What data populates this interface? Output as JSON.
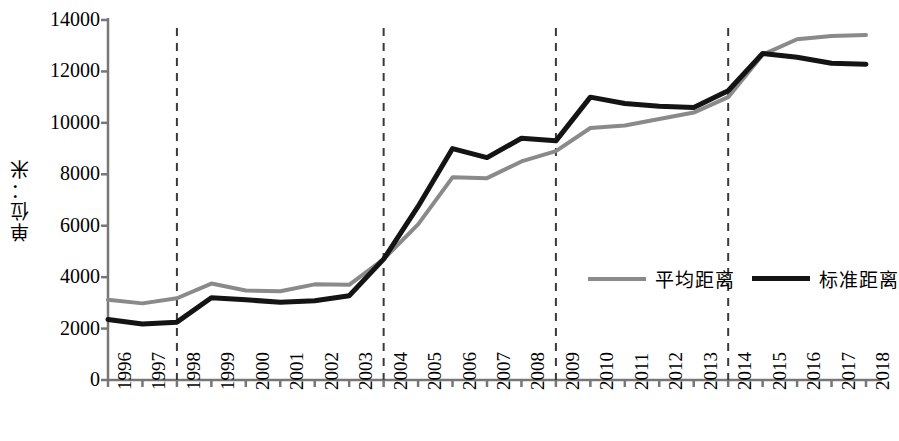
{
  "chart_data": {
    "type": "line",
    "title": "",
    "xlabel": "",
    "ylabel": "单位：米",
    "ylim": [
      0,
      14000
    ],
    "ytick_values": [
      0,
      2000,
      4000,
      6000,
      8000,
      10000,
      12000,
      14000
    ],
    "ytick_labels": [
      "0",
      "2000",
      "4000",
      "6000",
      "8000",
      "10000",
      "12000",
      "14000"
    ],
    "grid": false,
    "legend_position": "inside-lower-right",
    "categories": [
      1996,
      1997,
      1998,
      1999,
      2000,
      2001,
      2002,
      2003,
      2004,
      2005,
      2006,
      2007,
      2008,
      2009,
      2010,
      2011,
      2012,
      2013,
      2014,
      2015,
      2016,
      2017,
      2018
    ],
    "xtick_labels": [
      "1996",
      "1997",
      "1998",
      "1999",
      "2000",
      "2001",
      "2002",
      "2003",
      "2004",
      "2005",
      "2006",
      "2007",
      "2008",
      "2009",
      "2010",
      "2011",
      "2012",
      "2013",
      "2014",
      "2015",
      "2016",
      "2017",
      "2018"
    ],
    "series": [
      {
        "name": "平均距离",
        "color": "#8a8a8a",
        "width": 4,
        "values": [
          3120,
          2980,
          3180,
          3750,
          3480,
          3450,
          3720,
          3700,
          4700,
          6050,
          7880,
          7850,
          8500,
          8900,
          9800,
          9900,
          10150,
          10400,
          11000,
          12650,
          13250,
          13380,
          13420
        ]
      },
      {
        "name": "标准距离",
        "color": "#141414",
        "width": 5,
        "values": [
          2350,
          2180,
          2250,
          3200,
          3120,
          3020,
          3080,
          3280,
          4700,
          6750,
          9000,
          8650,
          9400,
          9300,
          11000,
          10750,
          10650,
          10600,
          11250,
          12700,
          12550,
          12320,
          12280
        ]
      }
    ],
    "reference_lines": [
      {
        "year": 1998,
        "style": "dashed"
      },
      {
        "year": 2004,
        "style": "dashed"
      },
      {
        "year": 2009,
        "style": "dashed"
      },
      {
        "year": 2014,
        "style": "dashed"
      }
    ],
    "axis_color": "#777777",
    "reference_line_color": "#3a3a3a"
  },
  "legend": {
    "items": [
      {
        "label": "平均距离",
        "key": "avg"
      },
      {
        "label": "标准距离",
        "key": "std"
      }
    ]
  }
}
